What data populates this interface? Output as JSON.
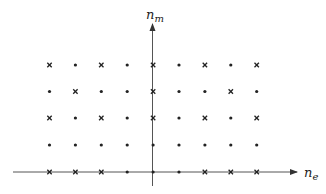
{
  "diagram": {
    "title": "",
    "axes": {
      "x_label": "n",
      "x_label_sub": "e",
      "y_label": "n",
      "y_label_sub": "m"
    },
    "grid": {
      "columns": [
        -4,
        -3,
        -2,
        -1,
        0,
        1,
        2,
        3,
        4
      ],
      "rows": [
        4,
        3,
        2,
        1,
        0
      ],
      "markers": [
        [
          "x",
          "dot",
          "x",
          "dot",
          "x",
          "dot",
          "x",
          "dot",
          "x"
        ],
        [
          "dot",
          "x",
          "dot",
          "dot",
          "x",
          "dot",
          "dot",
          "x",
          "dot"
        ],
        [
          "x",
          "dot",
          "x",
          "dot",
          "x",
          "dot",
          "x",
          "dot",
          "x"
        ],
        [
          "dot",
          "dot",
          "dot",
          "dot",
          "dot",
          "dot",
          "dot",
          "dot",
          "dot"
        ],
        [
          "x",
          "x",
          "x",
          "dot",
          "dot",
          "dot",
          "x",
          "x",
          "x"
        ]
      ]
    },
    "legend": {
      "x": "cross-marker",
      "dot": "dot-marker"
    },
    "colors": {
      "ink": "#222222",
      "axis": "#555555",
      "background": "#ffffff"
    }
  }
}
